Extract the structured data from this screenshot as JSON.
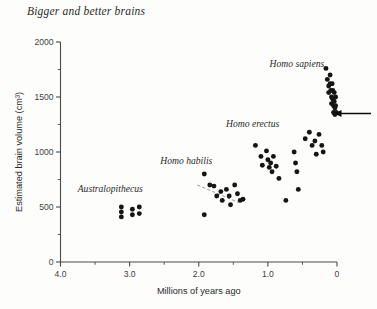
{
  "figure": {
    "title": "Bigger and better brains"
  },
  "chart_data": {
    "type": "scatter",
    "title": "Bigger and better brains",
    "xlabel": "Millions of years ago",
    "ylabel": "Estimated brain volume (cm³)",
    "xlim": [
      4.0,
      0
    ],
    "ylim": [
      0,
      2000
    ],
    "x_axis_reversed": true,
    "grid": false,
    "legend": "none",
    "x_ticks": [
      "4.0",
      "3.0",
      "2.0",
      "1.0",
      "0"
    ],
    "x_tick_values": [
      4.0,
      3.0,
      2.0,
      1.0,
      0
    ],
    "x_minor_tick_values": [
      3.5,
      2.5,
      1.5,
      0.5
    ],
    "y_ticks": [
      "0",
      "500",
      "1000",
      "1500",
      "2000"
    ],
    "y_tick_values": [
      0,
      500,
      1000,
      1500,
      2000
    ],
    "y_minor_tick_values": [
      250,
      750,
      1250,
      1750
    ],
    "annotations": [
      {
        "text": "Australopithecus",
        "x": 3.28,
        "y": 640
      },
      {
        "text": "Homo habilis",
        "x": 2.18,
        "y": 890
      },
      {
        "text": "Homo erectus",
        "x": 1.22,
        "y": 1230
      },
      {
        "text": "Homo sapiens",
        "x": 0.58,
        "y": 1770
      }
    ],
    "trend_line": {
      "label": "habilis-trend",
      "x_start": 2.02,
      "y_start": 700,
      "x_end": 1.42,
      "y_end": 540
    },
    "pointer_arrow": {
      "label": "brain-volume-pointer",
      "direction": "left",
      "y": 1350,
      "x_tail": 0.0,
      "note": "arrow in right margin pointing at ~1350 cm³"
    },
    "series": [
      {
        "name": "Australopithecus",
        "points": [
          [
            3.12,
            500
          ],
          [
            3.12,
            455
          ],
          [
            3.12,
            410
          ],
          [
            2.96,
            480
          ],
          [
            2.96,
            430
          ],
          [
            2.86,
            500
          ],
          [
            2.86,
            440
          ]
        ]
      },
      {
        "name": "Homo habilis",
        "points": [
          [
            1.92,
            800
          ],
          [
            1.84,
            700
          ],
          [
            1.78,
            690
          ],
          [
            1.74,
            600
          ],
          [
            1.68,
            640
          ],
          [
            1.66,
            560
          ],
          [
            1.6,
            660
          ],
          [
            1.56,
            600
          ],
          [
            1.54,
            520
          ],
          [
            1.48,
            700
          ],
          [
            1.44,
            620
          ],
          [
            1.4,
            560
          ],
          [
            1.92,
            430
          ],
          [
            1.36,
            570
          ]
        ]
      },
      {
        "name": "Homo erectus",
        "points": [
          [
            1.18,
            1060
          ],
          [
            1.1,
            960
          ],
          [
            1.08,
            880
          ],
          [
            1.02,
            1010
          ],
          [
            1.0,
            930
          ],
          [
            0.98,
            860
          ],
          [
            0.96,
            900
          ],
          [
            0.94,
            820
          ],
          [
            0.92,
            960
          ],
          [
            0.88,
            870
          ],
          [
            0.84,
            760
          ],
          [
            0.74,
            560
          ],
          [
            0.62,
            1000
          ],
          [
            0.6,
            900
          ],
          [
            0.58,
            820
          ],
          [
            0.56,
            660
          ],
          [
            0.46,
            1120
          ],
          [
            0.4,
            1180
          ],
          [
            0.36,
            1060
          ],
          [
            0.32,
            1100
          ],
          [
            0.3,
            980
          ],
          [
            0.26,
            1160
          ],
          [
            0.22,
            1060
          ],
          [
            0.2,
            1000
          ]
        ]
      },
      {
        "name": "Homo sapiens",
        "points": [
          [
            0.16,
            1760
          ],
          [
            0.14,
            1660
          ],
          [
            0.12,
            1600
          ],
          [
            0.12,
            1540
          ],
          [
            0.1,
            1700
          ],
          [
            0.1,
            1620
          ],
          [
            0.09,
            1560
          ],
          [
            0.08,
            1500
          ],
          [
            0.08,
            1440
          ],
          [
            0.07,
            1620
          ],
          [
            0.06,
            1560
          ],
          [
            0.06,
            1480
          ],
          [
            0.05,
            1420
          ],
          [
            0.05,
            1360
          ],
          [
            0.04,
            1540
          ],
          [
            0.04,
            1460
          ],
          [
            0.03,
            1400
          ],
          [
            0.03,
            1340
          ],
          [
            0.02,
            1500
          ],
          [
            0.02,
            1420
          ],
          [
            0.01,
            1360
          ]
        ]
      }
    ]
  }
}
